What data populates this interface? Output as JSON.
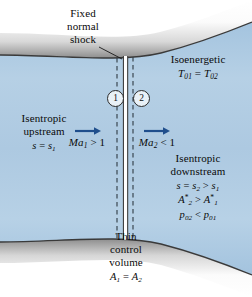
{
  "figure": {
    "type": "normal-shock-in-diverging-duct-schematic",
    "colors": {
      "fluid": "#a9c8e0",
      "fluid_light": "#bcd5e8",
      "wall_gray": "#8d8d8d",
      "wall_light": "#f7f7f7",
      "outline": "#3a3a3a",
      "arrow_blue": "#1f4e8c",
      "shock_fill": "#ffffff",
      "text": "#0a0a0a"
    }
  },
  "labels": {
    "shock": {
      "line1": "Fixed",
      "line2": "normal",
      "line3": "shock"
    },
    "isoenergetic": {
      "line1": "Isoenergetic",
      "eq": "T01 = T02",
      "eq_T": "T",
      "eq_sub1": "01",
      "eq_mid": " = ",
      "eq_T2": "T",
      "eq_sub2": "02"
    },
    "upstream": {
      "line1": "Isentropic",
      "line2": "upstream",
      "eq_s": "s",
      "eq_mid": " = ",
      "eq_s2": "s",
      "eq_sub": "1"
    },
    "downstream": {
      "line1": "Isentropic",
      "line2": "downstream",
      "eq1_s": "s",
      "eq1_mid": " = ",
      "eq1_s2": "s",
      "eq1_sub2": "2",
      "eq1_gt": " > ",
      "eq1_s3": "s",
      "eq1_sub3": "1",
      "eq2_A": "A",
      "eq2_star": "*",
      "eq2_sub": "2",
      "eq2_gt": " > ",
      "eq2_A2": "A",
      "eq2_star2": "*",
      "eq2_sub2": "1",
      "eq3_p": "p",
      "eq3_sub": "02",
      "eq3_lt": " < ",
      "eq3_p2": "p",
      "eq3_sub2": "01"
    },
    "control_volume": {
      "line1": "Thin",
      "line2": "control",
      "line3": "volume",
      "eq_A": "A",
      "eq_sub1": "1",
      "eq_mid": " = ",
      "eq_A2": "A",
      "eq_sub2": "2"
    },
    "mach1": {
      "ma": "Ma",
      "sub": "1",
      "rel": " > 1"
    },
    "mach2": {
      "ma": "Ma",
      "sub": "2",
      "rel": " < 1"
    },
    "station1": "1",
    "station2": "2"
  }
}
